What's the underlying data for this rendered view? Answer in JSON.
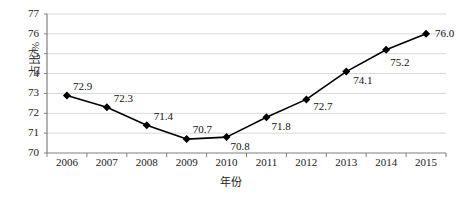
{
  "chart_data": {
    "type": "line",
    "title": "",
    "subtitle": "",
    "xlabel": "年份",
    "ylabel": "占比/%",
    "categories": [
      "2006",
      "2007",
      "2008",
      "2009",
      "2010",
      "2011",
      "2012",
      "2013",
      "2014",
      "2015"
    ],
    "values": [
      72.9,
      72.3,
      71.4,
      70.7,
      70.8,
      71.8,
      72.7,
      74.1,
      75.2,
      76.0
    ],
    "point_labels": [
      "72.9",
      "72.3",
      "71.4",
      "70.7",
      "70.8",
      "71.8",
      "72.7",
      "74.1",
      "75.2",
      "76.0"
    ],
    "ylim": [
      70,
      77
    ],
    "yticks": [
      70,
      71,
      72,
      73,
      74,
      75,
      76,
      77
    ],
    "ytick_labels": [
      "70",
      "71",
      "72",
      "73",
      "74",
      "75",
      "76",
      "77"
    ],
    "grid": true,
    "grid_axis": "y",
    "legend": false,
    "legend_position": "none",
    "series": [
      {
        "name": "占比/%",
        "values": [
          72.9,
          72.3,
          71.4,
          70.7,
          70.8,
          71.8,
          72.7,
          74.1,
          75.2,
          76.0
        ],
        "marker": "diamond",
        "color": "#000000"
      }
    ],
    "colors": {
      "line": "#000000",
      "marker": "#000000",
      "grid": "#d9d9d9",
      "axis": "#808080",
      "text": "#1a1a1a",
      "background": "#ffffff"
    }
  },
  "label_offsets": [
    {
      "dx": 6,
      "dy": -14
    },
    {
      "dx": 7,
      "dy": -14
    },
    {
      "dx": 7,
      "dy": -14
    },
    {
      "dx": 6,
      "dy": -15
    },
    {
      "dx": 4,
      "dy": 4
    },
    {
      "dx": 5,
      "dy": 4
    },
    {
      "dx": 7,
      "dy": 2
    },
    {
      "dx": 7,
      "dy": 3
    },
    {
      "dx": 4,
      "dy": 7
    },
    {
      "dx": 9,
      "dy": -6
    }
  ]
}
